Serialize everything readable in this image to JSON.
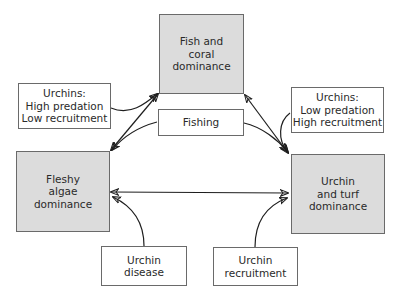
{
  "diagram": {
    "states": {
      "fish_coral": [
        "Fish and",
        "coral",
        "dominance"
      ],
      "fleshy_algae": [
        "Fleshy",
        "algae",
        "dominance"
      ],
      "urchin_turf": [
        "Urchin",
        "and turf",
        "dominance"
      ]
    },
    "drivers": {
      "urchins_high_predation": [
        "Urchins:",
        "High predation",
        "Low recruitment"
      ],
      "urchins_low_predation": [
        "Urchins:",
        "Low predation",
        "High recruitment"
      ],
      "fishing": [
        "Fishing"
      ],
      "urchin_disease": [
        "Urchin",
        "disease"
      ],
      "urchin_recruitment": [
        "Urchin",
        "recruitment"
      ]
    },
    "connections": [
      {
        "from": "fleshy_algae",
        "to": "fish_coral",
        "type": "bidirectional"
      },
      {
        "from": "fish_coral",
        "to": "urchin_turf",
        "type": "bidirectional"
      },
      {
        "from": "fleshy_algae",
        "to": "urchin_turf",
        "type": "bidirectional"
      },
      {
        "from": "urchins_high_predation",
        "to": "fish_coral",
        "type": "driver"
      },
      {
        "from": "fishing",
        "to": "fleshy_algae",
        "type": "driver"
      },
      {
        "from": "fishing",
        "to": "urchin_turf",
        "type": "driver"
      },
      {
        "from": "urchins_low_predation",
        "to": "urchin_turf",
        "type": "driver"
      },
      {
        "from": "urchin_disease",
        "to": "fleshy_algae",
        "type": "driver"
      },
      {
        "from": "urchin_recruitment",
        "to": "urchin_turf",
        "type": "driver"
      }
    ]
  }
}
